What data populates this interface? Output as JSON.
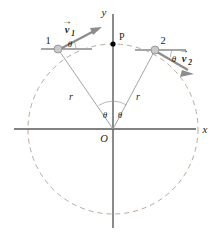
{
  "figure": {
    "title_text": "",
    "background_color": "#ffffff"
  },
  "colors": {
    "axis": "#58595b",
    "circle_dashed": "#b9a99a",
    "radius_line": "#9a9a9a",
    "vector": "#8c8c8c",
    "reference_line": "#a6a6a6",
    "particle_fill": "#c9c9c9",
    "particle_edge": "#8a8a8a",
    "point_p": "#000000",
    "text": "#231f20"
  },
  "axes": {
    "y_label": "y",
    "x_label": "x",
    "origin_label": "O"
  },
  "points": {
    "p_label": "P"
  },
  "particles": [
    {
      "id": "particle-1",
      "number_label": "1",
      "angle_label": "θ",
      "radius_label": "r",
      "center_angle_label": "θ",
      "velocity": {
        "symbol": "v",
        "subscript": "1",
        "vector_bar": "→"
      }
    },
    {
      "id": "particle-2",
      "number_label": "2",
      "angle_label": "θ",
      "radius_label": "r",
      "center_angle_label": "θ",
      "velocity": {
        "symbol": "v",
        "subscript": "2",
        "vector_bar": "→"
      }
    }
  ]
}
